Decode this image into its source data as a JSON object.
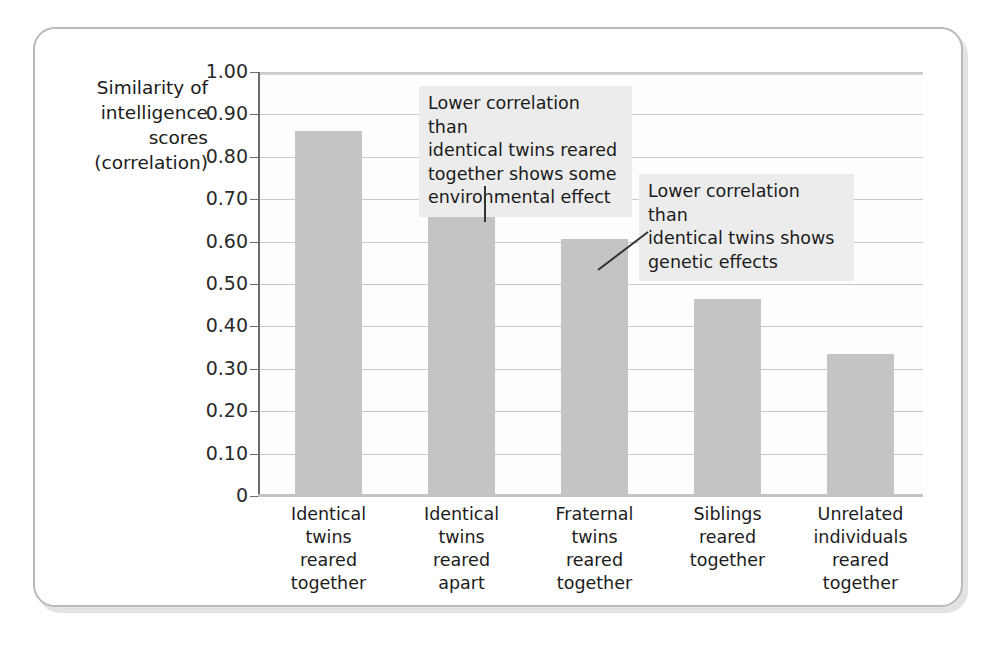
{
  "chart_data": {
    "type": "bar",
    "title": "",
    "xlabel": "",
    "ylabel": "Similarity of intelligence scores (correlation)",
    "ylim": [
      0,
      1.0
    ],
    "grid": true,
    "legend": "none",
    "categories": [
      "Identical twins reared together",
      "Identical twins reared apart",
      "Fraternal twins reared together",
      "Siblings reared together",
      "Unrelated individuals reared together"
    ],
    "category_lines": [
      [
        "Identical",
        "twins",
        "reared",
        "together"
      ],
      [
        "Identical",
        "twins",
        "reared",
        "apart"
      ],
      [
        "Fraternal",
        "twins",
        "reared",
        "together"
      ],
      [
        "Siblings",
        "reared",
        "together"
      ],
      [
        "Unrelated",
        "individuals",
        "reared",
        "together"
      ]
    ],
    "values": [
      0.86,
      0.725,
      0.605,
      0.465,
      0.335
    ],
    "ytick_labels": [
      "1.00",
      "0.90",
      "0.80",
      "0.70",
      "0.60",
      "0.50",
      "0.40",
      "0.30",
      "0.20",
      "0.10",
      "0"
    ],
    "ytick_values": [
      1.0,
      0.9,
      0.8,
      0.7,
      0.6,
      0.5,
      0.4,
      0.3,
      0.2,
      0.1,
      0
    ],
    "bar_color": "#c4c4c4",
    "gridline_color": "#c8c8c8",
    "annotations": [
      {
        "id": "environmental-effect",
        "lines": [
          "Lower correlation than",
          "identical twins reared",
          "together shows some",
          "environmental effect"
        ],
        "target_category": "Identical twins reared apart"
      },
      {
        "id": "genetic-effects",
        "lines": [
          "Lower correlation than",
          "identical twins shows",
          "genetic effects"
        ],
        "target_category": "Fraternal twins reared together"
      }
    ]
  },
  "y_axis_title_lines": [
    "Similarity of",
    "intelligence",
    "scores",
    "(correlation)"
  ]
}
